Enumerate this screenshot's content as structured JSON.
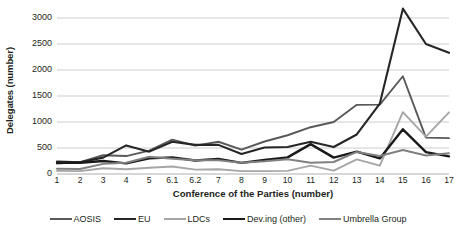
{
  "chart_data": {
    "type": "line",
    "title": "",
    "xlabel": "Conference of the Parties (number)",
    "ylabel": "Delegates (number)",
    "categories": [
      "1",
      "2",
      "3",
      "4",
      "5",
      "6.1",
      "6.2",
      "7",
      "8",
      "9",
      "10",
      "11",
      "12",
      "13",
      "14",
      "15",
      "16",
      "17"
    ],
    "ylim": [
      0,
      3000
    ],
    "yticks": [
      0,
      500,
      1000,
      1500,
      2000,
      2500,
      3000
    ],
    "grid": "horizontal",
    "legend_position": "bottom",
    "series": [
      {
        "name": "AOSIS",
        "color": "#595959",
        "width": 1.9,
        "values": [
          200,
          230,
          360,
          345,
          450,
          660,
          545,
          620,
          470,
          625,
          745,
          900,
          1000,
          1330,
          1335,
          1880,
          700,
          690
        ]
      },
      {
        "name": "EU",
        "color": "#262626",
        "width": 2.1,
        "values": [
          240,
          225,
          315,
          550,
          430,
          620,
          560,
          560,
          385,
          510,
          520,
          620,
          520,
          760,
          1355,
          3180,
          2500,
          2330
        ]
      },
      {
        "name": "LDCs",
        "color": "#a6a6a6",
        "width": 1.9,
        "values": [
          60,
          55,
          110,
          90,
          120,
          145,
          85,
          90,
          55,
          55,
          60,
          160,
          65,
          280,
          160,
          1190,
          720,
          1185
        ]
      },
      {
        "name": "Dev.ing (other)",
        "color": "#1a1a1a",
        "width": 2.4,
        "values": [
          215,
          215,
          250,
          205,
          300,
          320,
          260,
          290,
          215,
          270,
          320,
          575,
          315,
          430,
          300,
          860,
          420,
          340
        ]
      },
      {
        "name": "Umbrella Group",
        "color": "#808080",
        "width": 2.0,
        "values": [
          100,
          95,
          195,
          215,
          330,
          295,
          265,
          265,
          215,
          245,
          285,
          215,
          230,
          425,
          345,
          460,
          355,
          400
        ]
      }
    ]
  },
  "axes": {
    "y_tick_labels": [
      "3000",
      "2500",
      "2000",
      "1500",
      "1000",
      "500",
      "0"
    ],
    "y_title": "Delegates (number)",
    "x_title": "Conference of the Parties (number)",
    "x_tick_labels": [
      "1",
      "2",
      "3",
      "4",
      "5",
      "6.1",
      "6.2",
      "7",
      "8",
      "9",
      "10",
      "11",
      "12",
      "13",
      "14",
      "15",
      "16",
      "17"
    ]
  },
  "legend": {
    "items": [
      {
        "label": "AOSIS",
        "color": "#595959",
        "width": 2.2
      },
      {
        "label": "EU",
        "color": "#262626",
        "width": 2.6
      },
      {
        "label": "LDCs",
        "color": "#a6a6a6",
        "width": 2.2
      },
      {
        "label": "Dev.ing (other)",
        "color": "#1a1a1a",
        "width": 2.8
      },
      {
        "label": "Umbrella Group",
        "color": "#808080",
        "width": 2.2
      }
    ]
  }
}
